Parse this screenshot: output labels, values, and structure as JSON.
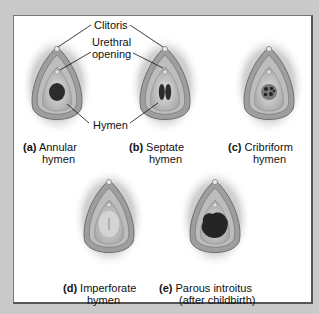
{
  "callouts": {
    "clitoris": "Clitoris",
    "urethral_opening_line1": "Urethral",
    "urethral_opening_line2": "opening",
    "hymen": "Hymen"
  },
  "figures": [
    {
      "letter": "(a)",
      "line1": "Annular",
      "line2": "hymen"
    },
    {
      "letter": "(b)",
      "line1": "Septate",
      "line2": "hymen"
    },
    {
      "letter": "(c)",
      "line1": "Cribriform",
      "line2": "hymen"
    },
    {
      "letter": "(d)",
      "line1": "Imperforate",
      "line2": "hymen"
    },
    {
      "letter": "(e)",
      "line1": "Parous introitus",
      "line2": "(after childbirth)"
    }
  ],
  "colors": {
    "background": "#c9c9c9",
    "panel": "#ffffff",
    "tissue": "#8a8a8a",
    "opening": "#2a2a2a"
  }
}
